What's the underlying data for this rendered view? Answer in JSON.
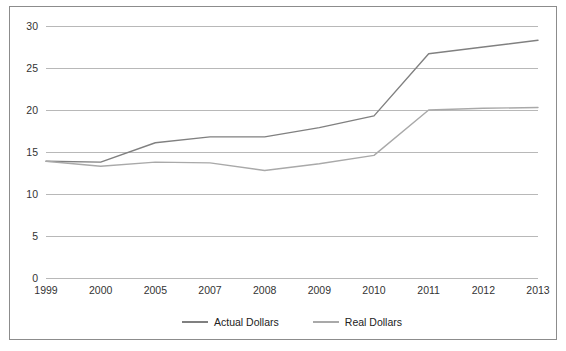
{
  "chart_data": {
    "type": "line",
    "title": "",
    "subtitle": "",
    "xlabel": "",
    "ylabel": "",
    "categories": [
      "1999",
      "2000",
      "2005",
      "2007",
      "2008",
      "2009",
      "2010",
      "2011",
      "2012",
      "2013"
    ],
    "series": [
      {
        "name": "Actual Dollars",
        "color": "#808080",
        "values": [
          13.9,
          13.8,
          16.1,
          16.8,
          16.8,
          17.9,
          19.3,
          26.7,
          27.5,
          28.3
        ]
      },
      {
        "name": "Real Dollars",
        "color": "#a9a9a9",
        "values": [
          13.9,
          13.3,
          13.8,
          13.7,
          12.8,
          13.6,
          14.6,
          20.0,
          20.2,
          20.3
        ]
      }
    ],
    "ylim": [
      0,
      30
    ],
    "yticks": [
      0,
      5,
      10,
      15,
      20,
      25,
      30
    ],
    "ytick_labels": [
      "0",
      "5",
      "10",
      "15",
      "20",
      "25",
      "30"
    ],
    "grid": true,
    "grid_color": "#b8b8b8",
    "legend_position": "bottom",
    "border_color": "#8c8c8c",
    "background_color": "#ffffff"
  }
}
